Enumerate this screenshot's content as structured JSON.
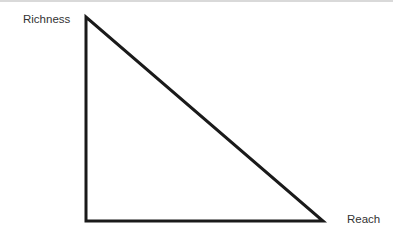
{
  "diagram": {
    "type": "right-triangle",
    "y_label": "Richness",
    "x_label": "Reach",
    "stroke_color": "#1a1a1a",
    "vertices": {
      "top": [
        86,
        17
      ],
      "bottom_left": [
        86,
        221
      ],
      "bottom_right": [
        323,
        221
      ]
    }
  }
}
